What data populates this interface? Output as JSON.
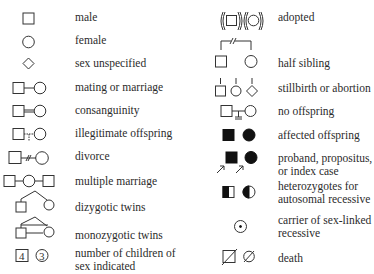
{
  "legend": {
    "left": [
      {
        "symbol": "male-square-icon",
        "label": "male"
      },
      {
        "symbol": "female-circle-icon",
        "label": "female"
      },
      {
        "symbol": "diamond-icon",
        "label": "sex unspecified"
      },
      {
        "symbol": "mating-line-icon",
        "label": "mating or marriage"
      },
      {
        "symbol": "consanguinity-icon",
        "label": "consanguinity"
      },
      {
        "symbol": "illegitimate-offspring-icon",
        "label": "illegitimate offspring"
      },
      {
        "symbol": "divorce-icon",
        "label": "divorce"
      },
      {
        "symbol": "multiple-marriage-icon",
        "label": "multiple marriage"
      },
      {
        "symbol": "dizygotic-twins-icon",
        "label": "dizygotic twins"
      },
      {
        "symbol": "monozygotic-twins-icon",
        "label": "monozygotic twins"
      },
      {
        "symbol": "number-of-children-icon",
        "label_line1": "number of children of",
        "label_line2": "sex indicated",
        "male_count": "4",
        "female_count": "3"
      }
    ],
    "right": [
      {
        "symbol": "adopted-icon",
        "label": "adopted"
      },
      {
        "symbol": "half-sibling-icon",
        "label": "half sibling"
      },
      {
        "symbol": "stillbirth-icon",
        "label": "stillbirth or abortion"
      },
      {
        "symbol": "no-offspring-icon",
        "label": "no offspring"
      },
      {
        "symbol": "affected-offspring-icon",
        "label": "affected offspring"
      },
      {
        "symbol": "proband-icon",
        "label_line1": "proband, propositus,",
        "label_line2": "or index case"
      },
      {
        "symbol": "heterozygote-icon",
        "label_line1": "heterozygotes for",
        "label_line2": "autosomal recessive"
      },
      {
        "symbol": "carrier-sex-linked-icon",
        "label_line1": "carrier of sex-linked",
        "label_line2": "recessive"
      },
      {
        "symbol": "death-icon",
        "label": "death"
      }
    ]
  }
}
